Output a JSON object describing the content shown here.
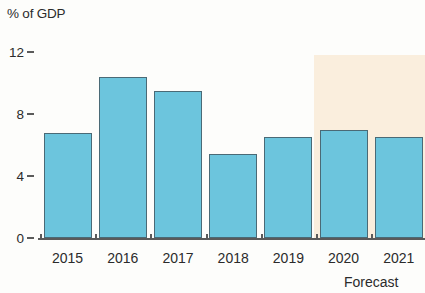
{
  "chart_data": {
    "type": "bar",
    "title": "",
    "ylabel": "% of GDP",
    "xlabel": "",
    "categories": [
      "2015",
      "2016",
      "2017",
      "2018",
      "2019",
      "2020",
      "2021"
    ],
    "values": [
      6.8,
      10.4,
      9.5,
      5.4,
      6.5,
      7.0,
      6.5
    ],
    "ylim": [
      0,
      12
    ],
    "y_ticks": [
      "0",
      "4",
      "8",
      "12"
    ],
    "y_tick_values": [
      0,
      4,
      8,
      12
    ],
    "grid": false,
    "legend": "none",
    "series": [
      {
        "name": "% of GDP",
        "values": [
          6.8,
          10.4,
          9.5,
          5.4,
          6.5,
          7.0,
          6.5
        ]
      }
    ],
    "annotations": [
      {
        "name": "forecast-label",
        "text": "Forecast",
        "covers": [
          "2020",
          "2021"
        ]
      }
    ],
    "forecast_region": {
      "label": "Forecast",
      "start_category": "2020",
      "end_category": "2021",
      "top_value": 11.8
    },
    "colors": {
      "bar_fill": "#6cc5dd",
      "bar_stroke": "#4a6a76",
      "forecast_band": "#faeedd",
      "axis": "#5a5a5a",
      "text": "#2b2b2b",
      "background": "#fdfdfb"
    }
  }
}
